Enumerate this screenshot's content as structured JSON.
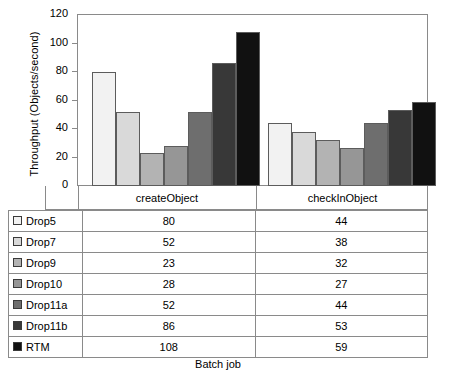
{
  "chart_data": {
    "type": "bar",
    "title": "",
    "xlabel": "Batch job",
    "ylabel": "Throughput (Objects/second)",
    "categories": [
      "createObject",
      "checkInObject"
    ],
    "ylim": [
      0,
      120
    ],
    "yticks": [
      0,
      20,
      40,
      60,
      80,
      100,
      120
    ],
    "grid": false,
    "legend_position": "table-left-column",
    "series": [
      {
        "name": "Drop5",
        "color": "#f2f2f2",
        "values": [
          80,
          44
        ]
      },
      {
        "name": "Drop7",
        "color": "#d9d9d9",
        "values": [
          52,
          38
        ]
      },
      {
        "name": "Drop9",
        "color": "#b3b3b3",
        "values": [
          23,
          32
        ]
      },
      {
        "name": "Drop10",
        "color": "#969696",
        "values": [
          28,
          27
        ]
      },
      {
        "name": "Drop11a",
        "color": "#6e6e6e",
        "values": [
          52,
          44
        ]
      },
      {
        "name": "Drop11b",
        "color": "#383838",
        "values": [
          86,
          53
        ]
      },
      {
        "name": "RTM",
        "color": "#111111",
        "values": [
          108,
          59
        ]
      }
    ]
  },
  "table": {
    "columns": [
      "",
      "createObject",
      "checkInObject"
    ],
    "rows": [
      {
        "label": "Drop5",
        "values": [
          "80",
          "44"
        ]
      },
      {
        "label": "Drop7",
        "values": [
          "52",
          "38"
        ]
      },
      {
        "label": "Drop9",
        "values": [
          "23",
          "32"
        ]
      },
      {
        "label": "Drop10",
        "values": [
          "28",
          "27"
        ]
      },
      {
        "label": "Drop11a",
        "values": [
          "52",
          "44"
        ]
      },
      {
        "label": "Drop11b",
        "values": [
          "86",
          "53"
        ]
      },
      {
        "label": "RTM",
        "values": [
          "108",
          "59"
        ]
      }
    ]
  },
  "axis": {
    "y_title": "Throughput (Objects/second)",
    "x_title": "Batch job",
    "y_tick_labels": [
      "120",
      "100",
      "80",
      "60",
      "40",
      "20",
      "0"
    ]
  }
}
